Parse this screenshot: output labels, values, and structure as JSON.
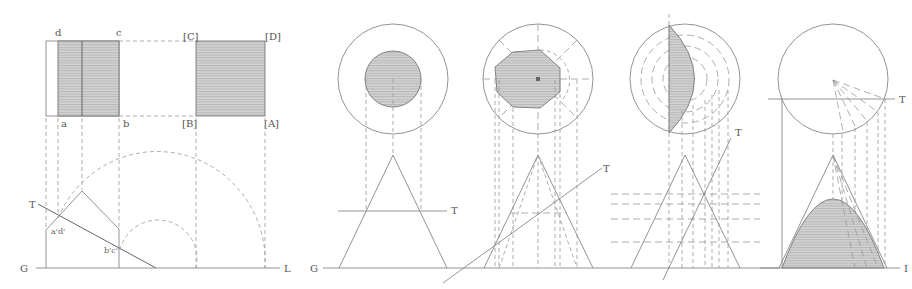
{
  "figure": {
    "panels": [
      {
        "id": "prism",
        "labels": {
          "d": "d",
          "c": "c",
          "C": "[C]",
          "D": "[D]",
          "a": "a",
          "b": "b",
          "B": "[B]",
          "A": "[A]",
          "ad": "a'd'",
          "bc": "b'c'",
          "T": "T",
          "G": "G",
          "L": "L"
        }
      },
      {
        "id": "cone-horizontal-section",
        "labels": {
          "T": "T",
          "G": "G"
        }
      },
      {
        "id": "cone-oblique-section",
        "labels": {
          "T": "T"
        }
      },
      {
        "id": "cone-steep-section",
        "labels": {
          "T": "T"
        }
      },
      {
        "id": "cone-vertical-section",
        "labels": {
          "T": "T",
          "L": "I"
        }
      }
    ]
  }
}
